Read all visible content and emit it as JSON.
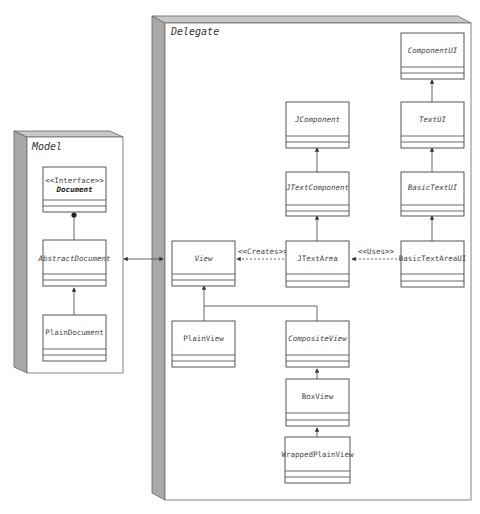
{
  "packages": [
    {
      "id": "model",
      "label": "Model"
    },
    {
      "id": "delegate",
      "label": "Delegate"
    }
  ],
  "classes": {
    "document": {
      "stereotype": "<<Interface>>",
      "name": "Document",
      "style": "bold-italic"
    },
    "abstract_document": {
      "name": "AbstractDocument",
      "style": "italic"
    },
    "plain_document": {
      "name": "PlainDocument",
      "style": "normal"
    },
    "component_ui": {
      "name": "ComponentUI",
      "style": "italic"
    },
    "text_ui": {
      "name": "TextUI",
      "style": "italic"
    },
    "basic_text_ui": {
      "name": "BasicTextUI",
      "style": "italic"
    },
    "basic_text_area_ui": {
      "name": "BasicTextAreaUI",
      "style": "normal"
    },
    "jcomponent": {
      "name": "JComponent",
      "style": "italic"
    },
    "jtext_component": {
      "name": "JTextComponent",
      "style": "italic"
    },
    "jtext_area": {
      "name": "JTextArea",
      "style": "normal"
    },
    "view": {
      "name": "View",
      "style": "italic"
    },
    "plain_view": {
      "name": "PlainView",
      "style": "normal"
    },
    "composite_view": {
      "name": "CompositeView",
      "style": "italic"
    },
    "box_view": {
      "name": "BoxView",
      "style": "normal"
    },
    "wrapped_plain_view": {
      "name": "WrappedPlainView",
      "style": "normal"
    }
  },
  "relations": {
    "creates_label": "<<Creates>>",
    "uses_label": "<<Uses>>"
  },
  "colors": {
    "line": "#555555",
    "box_border": "#444444",
    "package_side": "#a8a8a8",
    "package_top": "#c8c8c8",
    "background": "#ffffff"
  }
}
